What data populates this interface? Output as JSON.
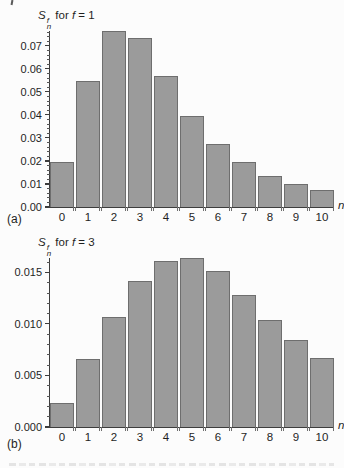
{
  "colors": {
    "bar_fill": "#9b9b9b",
    "bar_border": "#6e6e6e",
    "axis": "#3d3d3d",
    "text": "#1f1f1f",
    "background": "#fcfcfc"
  },
  "chart_data": [
    {
      "type": "bar",
      "panel_label": "(a)",
      "title": {
        "base": "S",
        "sup": "f",
        "sub": "n",
        "mid": " for ",
        "var": "f",
        "val": " = 1"
      },
      "xlabel": "n",
      "ylabel": "",
      "categories": [
        0,
        1,
        2,
        3,
        4,
        5,
        6,
        7,
        8,
        9,
        10
      ],
      "values": [
        0.0195,
        0.055,
        0.0765,
        0.0735,
        0.057,
        0.0395,
        0.0275,
        0.0195,
        0.0135,
        0.01,
        0.0075
      ],
      "ylim": [
        0,
        0.0765
      ],
      "y_ticks": [
        "0.00",
        "0.01",
        "0.02",
        "0.03",
        "0.04",
        "0.05",
        "0.06",
        "0.07"
      ],
      "y_major_step": 0.01,
      "y_minor_step": 0.002,
      "grid": false,
      "legend": false
    },
    {
      "type": "bar",
      "panel_label": "(b)",
      "title": {
        "base": "S",
        "sup": "f",
        "sub": "n",
        "mid": " for ",
        "var": "f",
        "val": " = 3"
      },
      "xlabel": "n",
      "ylabel": "",
      "categories": [
        0,
        1,
        2,
        3,
        4,
        5,
        6,
        7,
        8,
        9,
        10
      ],
      "values": [
        0.0023,
        0.0066,
        0.0107,
        0.0142,
        0.0161,
        0.0164,
        0.0151,
        0.0128,
        0.0104,
        0.0084,
        0.0067
      ],
      "ylim": [
        0,
        0.0164
      ],
      "y_ticks": [
        "0.000",
        "0.005",
        "0.010",
        "0.015"
      ],
      "y_major_step": 0.005,
      "y_minor_step": 0.001,
      "grid": false,
      "legend": false
    }
  ]
}
